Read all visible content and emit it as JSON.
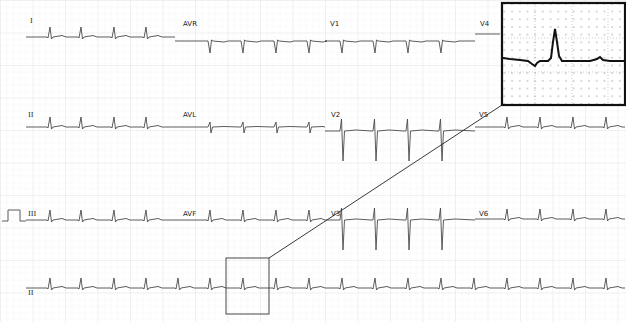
{
  "figure": {
    "type": "12-lead ECG with magnified inset",
    "grid_color_minor": "#ececec",
    "grid_color_major": "#d9d9d9",
    "trace_color": "#4a4a4a",
    "annotation_color": "#222222"
  },
  "leads": [
    {
      "label": "I",
      "row": 0,
      "col": 0,
      "x": 30,
      "y": 23
    },
    {
      "label": "AVR",
      "row": 0,
      "col": 1,
      "x": 183,
      "y": 26
    },
    {
      "label": "V1",
      "row": 0,
      "col": 2,
      "x": 330,
      "y": 26
    },
    {
      "label": "V4",
      "row": 0,
      "col": 3,
      "x": 480,
      "y": 26
    },
    {
      "label": "II",
      "row": 1,
      "col": 0,
      "x": 28,
      "y": 117
    },
    {
      "label": "AVL",
      "row": 1,
      "col": 1,
      "x": 183,
      "y": 117
    },
    {
      "label": "V2",
      "row": 1,
      "col": 2,
      "x": 331,
      "y": 117
    },
    {
      "label": "V5",
      "row": 1,
      "col": 3,
      "x": 479,
      "y": 117
    },
    {
      "label": "III",
      "row": 2,
      "col": 0,
      "x": 28,
      "y": 216
    },
    {
      "label": "AVF",
      "row": 2,
      "col": 1,
      "x": 183,
      "y": 216
    },
    {
      "label": "V3",
      "row": 2,
      "col": 2,
      "x": 331,
      "y": 216
    },
    {
      "label": "V6",
      "row": 2,
      "col": 3,
      "x": 479,
      "y": 216
    },
    {
      "label": "II",
      "row": 3,
      "col": "rhythm",
      "x": 28,
      "y": 295
    }
  ],
  "calibration_pulse": {
    "label": "1 mV calibration",
    "x": 2,
    "y": 210
  },
  "magnifier": {
    "source_box": {
      "x": 226,
      "y": 258,
      "w": 43,
      "h": 56
    },
    "inset": {
      "x": 502,
      "y": 3,
      "w": 123,
      "h": 102
    },
    "description": "Magnified single P-QRS-T complex from rhythm strip lead II"
  }
}
